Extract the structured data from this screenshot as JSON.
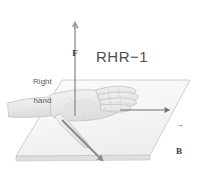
{
  "figure": {
    "background_color": "#ffffff",
    "width": 198,
    "height": 180
  },
  "annotations": {
    "title_label": "RHR−1",
    "hand_label_line1": "Right",
    "hand_label_line2": "hand"
  },
  "vectors": [
    {
      "id": "force",
      "symbol": "F",
      "arrow_bar": "→",
      "label": "F",
      "direction": "up",
      "color": "#8c8c8c"
    },
    {
      "id": "magnetic-field",
      "symbol": "B",
      "arrow_bar": "→",
      "label": "B",
      "direction": "right",
      "color": "#6e6e6e"
    },
    {
      "id": "velocity",
      "symbol": "v",
      "arrow_bar": "→",
      "label": "v",
      "direction": "down-right",
      "color": "#8a8a8a"
    }
  ],
  "colors": {
    "plane_fill": "#f4f4f4",
    "plane_edge": "#c9c9c9",
    "plane_side": "#dcdcdc",
    "hand_fill": "#ececec",
    "hand_outline": "#c0c0c0",
    "arrow_force": "#9a9a9a",
    "arrow_field": "#6e6e6e",
    "arrow_velocity": "#8a8a8a",
    "text": "#4a4a4a"
  },
  "diagram": {
    "type": "physics-right-hand-rule",
    "plane_polygon": [
      [
        62,
        80
      ],
      [
        190,
        80
      ],
      [
        150,
        155
      ],
      [
        16,
        156
      ]
    ],
    "force_arrow": {
      "x1": 75,
      "y1": 116,
      "x2": 75,
      "y2": 21
    },
    "field_arrow": {
      "x1": 120,
      "y1": 110,
      "x2": 170,
      "y2": 110
    },
    "velocity_arrow": {
      "x1": 62,
      "y1": 120,
      "x2": 104,
      "y2": 162
    }
  }
}
